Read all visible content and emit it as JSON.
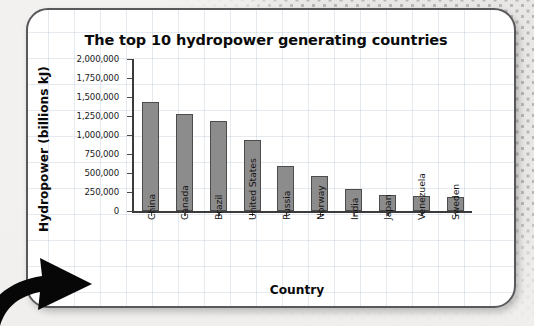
{
  "card": {
    "border_color": "#59595b",
    "background": "#ffffff"
  },
  "decor": {
    "background_color": "#e9e7e6",
    "dot_color": "#b9b7b6",
    "arrow_icon": "curved-arrow-up-right",
    "arrow_color": "#000000"
  },
  "chart_data": {
    "type": "bar",
    "title": "The top 10 hydropower generating countries",
    "xlabel": "Country",
    "ylabel": "Hydropower (billions kJ)",
    "categories": [
      "China",
      "Canada",
      "Brazil",
      "United States",
      "Russia",
      "Norway",
      "India",
      "Japan",
      "Venezuela",
      "Sweden"
    ],
    "values": [
      1430000,
      1270000,
      1190000,
      940000,
      590000,
      455000,
      295000,
      215000,
      195000,
      180000
    ],
    "ylim": [
      0,
      2000000
    ],
    "ytick_step": 250000,
    "ytick_labels": [
      "2,000,000",
      "1,750,000",
      "1,500,000",
      "1,250,000",
      "1,000,000",
      "750,000",
      "500,000",
      "250,000",
      "0"
    ],
    "ytick_values": [
      2000000,
      1750000,
      1500000,
      1250000,
      1000000,
      750000,
      500000,
      250000,
      0
    ],
    "grid": false,
    "legend": false,
    "bar_color": "#8c8c8c",
    "bar_edge_color": "#4c4c4c",
    "axis_color": "#3b3b3b"
  }
}
